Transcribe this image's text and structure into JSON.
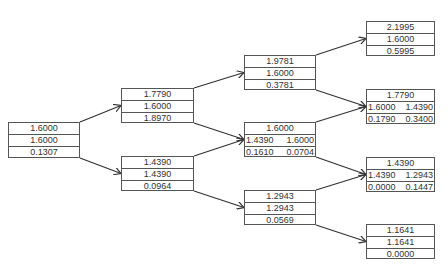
{
  "diagram": {
    "type": "binomial-tree",
    "nodes": {
      "n0": {
        "rows": [
          [
            "1.6000"
          ],
          [
            "1.6000"
          ],
          [
            "0.1307"
          ]
        ]
      },
      "n1u": {
        "rows": [
          [
            "1.7790"
          ],
          [
            "1.6000"
          ],
          [
            "1.8970"
          ]
        ]
      },
      "n1d": {
        "rows": [
          [
            "1.4390"
          ],
          [
            "1.4390"
          ],
          [
            "0.0964"
          ]
        ]
      },
      "n2uu": {
        "rows": [
          [
            "1.9781"
          ],
          [
            "1.6000"
          ],
          [
            "0.3781"
          ]
        ]
      },
      "n2ud": {
        "rows": [
          [
            "1.6000"
          ],
          [
            "1.4390",
            "1.6000"
          ],
          [
            "0.1610",
            "0.0704"
          ]
        ]
      },
      "n2dd": {
        "rows": [
          [
            "1.2943"
          ],
          [
            "1.2943"
          ],
          [
            "0.0569"
          ]
        ]
      },
      "n3uuu": {
        "rows": [
          [
            "2.1995"
          ],
          [
            "1.6000"
          ],
          [
            "0.5995"
          ]
        ]
      },
      "n3uud": {
        "rows": [
          [
            "1.7790"
          ],
          [
            "1.6000",
            "1.4390"
          ],
          [
            "0.1790",
            "0.3400"
          ]
        ]
      },
      "n3udd": {
        "rows": [
          [
            "1.4390"
          ],
          [
            "1.4390",
            "1.2943"
          ],
          [
            "0.0000",
            "0.1447"
          ]
        ]
      },
      "n3ddd": {
        "rows": [
          [
            "1.1641"
          ],
          [
            "1.1641"
          ],
          [
            "0.0000"
          ]
        ]
      }
    },
    "edges": [
      [
        "n0",
        "n1u"
      ],
      [
        "n0",
        "n1d"
      ],
      [
        "n1u",
        "n2uu"
      ],
      [
        "n1u",
        "n2ud"
      ],
      [
        "n1d",
        "n2ud"
      ],
      [
        "n1d",
        "n2dd"
      ],
      [
        "n2uu",
        "n3uuu"
      ],
      [
        "n2uu",
        "n3uud"
      ],
      [
        "n2ud",
        "n3uud"
      ],
      [
        "n2ud",
        "n3udd"
      ],
      [
        "n2dd",
        "n3udd"
      ],
      [
        "n2dd",
        "n3ddd"
      ]
    ],
    "colors": {
      "line": "#333333",
      "border": "#555555",
      "text": "#333333"
    }
  }
}
